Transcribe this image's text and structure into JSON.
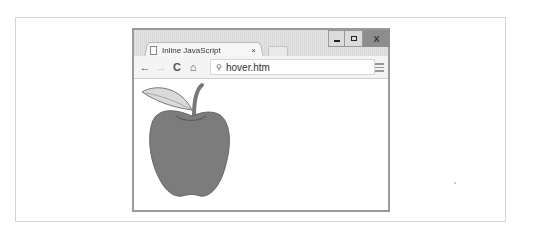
{
  "browser": {
    "tab": {
      "title": "Inline JavaScript",
      "close_label": "×",
      "icon": "document-icon"
    },
    "window_controls": {
      "minimize": "minimize-icon",
      "maximize": "maximize-icon",
      "close_label": "X"
    },
    "toolbar": {
      "back": "←",
      "forward": "→",
      "reload": "C",
      "home": "⌂",
      "address": {
        "icon": "search-icon",
        "glyph": "⚲",
        "value": "hover.htm"
      },
      "menu": "menu-icon"
    },
    "content": {
      "image": "apple-image"
    }
  },
  "colors": {
    "apple": "#7a7a7a",
    "leaf": "#d9d9d9",
    "titlebar": "#dedede",
    "close_button": "#8d8d8d"
  }
}
